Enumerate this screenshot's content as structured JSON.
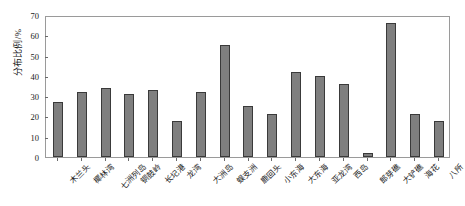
{
  "chart_data": {
    "type": "bar",
    "title": "",
    "xlabel": "",
    "ylabel": "分布比例/%",
    "ylim": [
      0,
      70
    ],
    "yticks": [
      0,
      10,
      20,
      30,
      40,
      50,
      60,
      70
    ],
    "grid": false,
    "legend": "none",
    "bar_color": "#7f7f7f",
    "bar_border_color": "#3a3a3a",
    "axis_color": "#9a9a9a",
    "categories": [
      "木兰头",
      "椰林湾",
      "七洲列岛",
      "铜鼓岭",
      "长圮港",
      "龙湾",
      "大洲岛",
      "蜈支洲",
      "鹿回头",
      "小东海",
      "大东海",
      "亚龙湾",
      "西岛",
      "郎芽礁",
      "大铲礁",
      "海花",
      "八所"
    ],
    "values": [
      27,
      32,
      34,
      31,
      33,
      18,
      32,
      55,
      25,
      21,
      42,
      40,
      36,
      2,
      66,
      21,
      18
    ],
    "series": [
      {
        "name": "分布比例",
        "values": [
          27,
          32,
          34,
          31,
          33,
          18,
          32,
          55,
          25,
          21,
          42,
          40,
          36,
          2,
          66,
          21,
          18
        ]
      }
    ]
  }
}
